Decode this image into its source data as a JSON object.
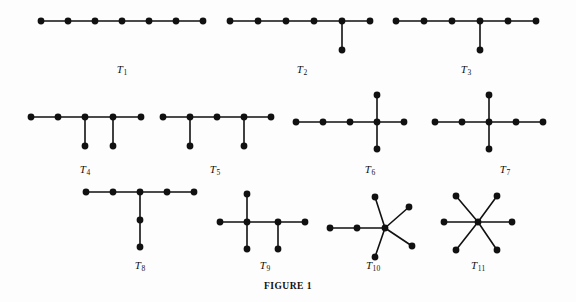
{
  "figure": {
    "caption": "FIGURE 1",
    "background_color": "#fdfdfd",
    "ink_color": "#111111",
    "node_radius": 3.4,
    "edge_width": 1.6
  },
  "chart_data": {
    "type": "diagram",
    "title": "FIGURE 1",
    "xlabel": "",
    "ylabel": "",
    "graphs": [
      {
        "label": "T1",
        "label_text": "T",
        "label_sub": "1",
        "label_x": 122,
        "label_y": 63,
        "vertices": 7,
        "edges_count": 6,
        "nodes": [
          {
            "id": 0,
            "x": 41,
            "y": 21
          },
          {
            "id": 1,
            "x": 68,
            "y": 21
          },
          {
            "id": 2,
            "x": 95,
            "y": 21
          },
          {
            "id": 3,
            "x": 122,
            "y": 21
          },
          {
            "id": 4,
            "x": 149,
            "y": 21
          },
          {
            "id": 5,
            "x": 176,
            "y": 21
          },
          {
            "id": 6,
            "x": 203,
            "y": 21
          }
        ],
        "edges": [
          [
            0,
            1
          ],
          [
            1,
            2
          ],
          [
            2,
            3
          ],
          [
            3,
            4
          ],
          [
            4,
            5
          ],
          [
            5,
            6
          ]
        ]
      },
      {
        "label": "T2",
        "label_text": "T",
        "label_sub": "2",
        "label_x": 302,
        "label_y": 63,
        "vertices": 7,
        "edges_count": 6,
        "nodes": [
          {
            "id": 0,
            "x": 230,
            "y": 21
          },
          {
            "id": 1,
            "x": 258,
            "y": 21
          },
          {
            "id": 2,
            "x": 286,
            "y": 21
          },
          {
            "id": 3,
            "x": 314,
            "y": 21
          },
          {
            "id": 4,
            "x": 342,
            "y": 21
          },
          {
            "id": 5,
            "x": 370,
            "y": 21
          },
          {
            "id": 6,
            "x": 342,
            "y": 50
          }
        ],
        "edges": [
          [
            0,
            1
          ],
          [
            1,
            2
          ],
          [
            2,
            3
          ],
          [
            3,
            4
          ],
          [
            4,
            5
          ],
          [
            4,
            6
          ]
        ]
      },
      {
        "label": "T3",
        "label_text": "T",
        "label_sub": "3",
        "label_x": 466,
        "label_y": 63,
        "vertices": 7,
        "edges_count": 6,
        "nodes": [
          {
            "id": 0,
            "x": 396,
            "y": 21
          },
          {
            "id": 1,
            "x": 424,
            "y": 21
          },
          {
            "id": 2,
            "x": 452,
            "y": 21
          },
          {
            "id": 3,
            "x": 480,
            "y": 21
          },
          {
            "id": 4,
            "x": 508,
            "y": 21
          },
          {
            "id": 5,
            "x": 536,
            "y": 21
          },
          {
            "id": 6,
            "x": 480,
            "y": 50
          }
        ],
        "edges": [
          [
            0,
            1
          ],
          [
            1,
            2
          ],
          [
            2,
            3
          ],
          [
            3,
            4
          ],
          [
            4,
            5
          ],
          [
            3,
            6
          ]
        ]
      },
      {
        "label": "T4",
        "label_text": "T",
        "label_sub": "4",
        "label_x": 85,
        "label_y": 163,
        "vertices": 7,
        "edges_count": 6,
        "nodes": [
          {
            "id": 0,
            "x": 31,
            "y": 117
          },
          {
            "id": 1,
            "x": 58,
            "y": 117
          },
          {
            "id": 2,
            "x": 85,
            "y": 117
          },
          {
            "id": 3,
            "x": 113,
            "y": 117
          },
          {
            "id": 4,
            "x": 141,
            "y": 117
          },
          {
            "id": 5,
            "x": 85,
            "y": 146
          },
          {
            "id": 6,
            "x": 113,
            "y": 146
          }
        ],
        "edges": [
          [
            0,
            1
          ],
          [
            1,
            2
          ],
          [
            2,
            3
          ],
          [
            3,
            4
          ],
          [
            2,
            5
          ],
          [
            3,
            6
          ]
        ]
      },
      {
        "label": "T5",
        "label_text": "T",
        "label_sub": "5",
        "label_x": 215,
        "label_y": 163,
        "vertices": 7,
        "edges_count": 6,
        "nodes": [
          {
            "id": 0,
            "x": 163,
            "y": 117
          },
          {
            "id": 1,
            "x": 190,
            "y": 117
          },
          {
            "id": 2,
            "x": 217,
            "y": 117
          },
          {
            "id": 3,
            "x": 244,
            "y": 117
          },
          {
            "id": 4,
            "x": 271,
            "y": 117
          },
          {
            "id": 5,
            "x": 190,
            "y": 146
          },
          {
            "id": 6,
            "x": 244,
            "y": 146
          }
        ],
        "edges": [
          [
            0,
            1
          ],
          [
            1,
            2
          ],
          [
            2,
            3
          ],
          [
            3,
            4
          ],
          [
            1,
            5
          ],
          [
            3,
            6
          ]
        ]
      },
      {
        "label": "T6",
        "label_text": "T",
        "label_sub": "6",
        "label_x": 370,
        "label_y": 163,
        "vertices": 7,
        "edges_count": 6,
        "nodes": [
          {
            "id": 0,
            "x": 296,
            "y": 122
          },
          {
            "id": 1,
            "x": 323,
            "y": 122
          },
          {
            "id": 2,
            "x": 350,
            "y": 122
          },
          {
            "id": 3,
            "x": 377,
            "y": 122
          },
          {
            "id": 4,
            "x": 404,
            "y": 122
          },
          {
            "id": 5,
            "x": 377,
            "y": 95
          },
          {
            "id": 6,
            "x": 377,
            "y": 149
          }
        ],
        "edges": [
          [
            0,
            1
          ],
          [
            1,
            2
          ],
          [
            2,
            3
          ],
          [
            3,
            4
          ],
          [
            3,
            5
          ],
          [
            3,
            6
          ]
        ]
      },
      {
        "label": "T7",
        "label_text": "T",
        "label_sub": "7",
        "label_x": 505,
        "label_y": 163,
        "vertices": 7,
        "edges_count": 6,
        "nodes": [
          {
            "id": 0,
            "x": 435,
            "y": 122
          },
          {
            "id": 1,
            "x": 462,
            "y": 122
          },
          {
            "id": 2,
            "x": 489,
            "y": 122
          },
          {
            "id": 3,
            "x": 516,
            "y": 122
          },
          {
            "id": 4,
            "x": 543,
            "y": 122
          },
          {
            "id": 5,
            "x": 489,
            "y": 95
          },
          {
            "id": 6,
            "x": 489,
            "y": 149
          }
        ],
        "edges": [
          [
            0,
            1
          ],
          [
            1,
            2
          ],
          [
            2,
            3
          ],
          [
            3,
            4
          ],
          [
            2,
            5
          ],
          [
            2,
            6
          ]
        ]
      },
      {
        "label": "T8",
        "label_text": "T",
        "label_sub": "8",
        "label_x": 140,
        "label_y": 259,
        "vertices": 7,
        "edges_count": 6,
        "nodes": [
          {
            "id": 0,
            "x": 86,
            "y": 192
          },
          {
            "id": 1,
            "x": 113,
            "y": 192
          },
          {
            "id": 2,
            "x": 140,
            "y": 192
          },
          {
            "id": 3,
            "x": 167,
            "y": 192
          },
          {
            "id": 4,
            "x": 194,
            "y": 192
          },
          {
            "id": 5,
            "x": 140,
            "y": 220
          },
          {
            "id": 6,
            "x": 140,
            "y": 247
          }
        ],
        "edges": [
          [
            0,
            1
          ],
          [
            1,
            2
          ],
          [
            2,
            3
          ],
          [
            3,
            4
          ],
          [
            2,
            5
          ],
          [
            5,
            6
          ]
        ]
      },
      {
        "label": "T9",
        "label_text": "T",
        "label_sub": "9",
        "label_x": 265,
        "label_y": 259,
        "vertices": 7,
        "edges_count": 6,
        "nodes": [
          {
            "id": 0,
            "x": 220,
            "y": 222
          },
          {
            "id": 1,
            "x": 247,
            "y": 222
          },
          {
            "id": 2,
            "x": 278,
            "y": 222
          },
          {
            "id": 3,
            "x": 305,
            "y": 222
          },
          {
            "id": 4,
            "x": 247,
            "y": 194
          },
          {
            "id": 5,
            "x": 247,
            "y": 249
          },
          {
            "id": 6,
            "x": 278,
            "y": 249
          }
        ],
        "edges": [
          [
            0,
            1
          ],
          [
            1,
            2
          ],
          [
            2,
            3
          ],
          [
            1,
            4
          ],
          [
            1,
            5
          ],
          [
            2,
            6
          ]
        ]
      },
      {
        "label": "T10",
        "label_text": "T",
        "label_sub": "10",
        "label_x": 373,
        "label_y": 259,
        "vertices": 7,
        "edges_count": 6,
        "nodes": [
          {
            "id": 0,
            "x": 330,
            "y": 228
          },
          {
            "id": 1,
            "x": 357,
            "y": 228
          },
          {
            "id": 2,
            "x": 385,
            "y": 228
          },
          {
            "id": 3,
            "x": 375,
            "y": 197
          },
          {
            "id": 4,
            "x": 409,
            "y": 207
          },
          {
            "id": 5,
            "x": 412,
            "y": 246
          },
          {
            "id": 6,
            "x": 375,
            "y": 257
          }
        ],
        "edges": [
          [
            0,
            1
          ],
          [
            1,
            2
          ],
          [
            2,
            3
          ],
          [
            2,
            4
          ],
          [
            2,
            5
          ],
          [
            2,
            6
          ]
        ]
      },
      {
        "label": "T11",
        "label_text": "T",
        "label_sub": "11",
        "label_x": 478,
        "label_y": 259,
        "vertices": 7,
        "edges_count": 6,
        "nodes": [
          {
            "id": 0,
            "x": 478,
            "y": 222
          },
          {
            "id": 1,
            "x": 444,
            "y": 222
          },
          {
            "id": 2,
            "x": 512,
            "y": 222
          },
          {
            "id": 3,
            "x": 456,
            "y": 196
          },
          {
            "id": 4,
            "x": 497,
            "y": 196
          },
          {
            "id": 5,
            "x": 456,
            "y": 250
          },
          {
            "id": 6,
            "x": 497,
            "y": 250
          }
        ],
        "edges": [
          [
            0,
            1
          ],
          [
            0,
            2
          ],
          [
            0,
            3
          ],
          [
            0,
            4
          ],
          [
            0,
            5
          ],
          [
            0,
            6
          ]
        ]
      }
    ]
  }
}
